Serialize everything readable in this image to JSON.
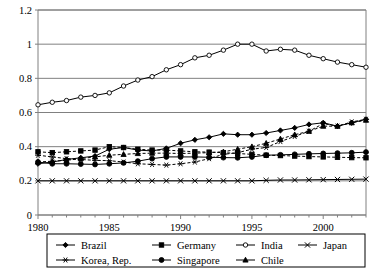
{
  "chart_data": {
    "type": "line",
    "title": "",
    "xlabel": "",
    "ylabel": "",
    "xlim": [
      1980,
      2003
    ],
    "ylim": [
      0,
      1.2
    ],
    "yticks": [
      "0",
      "0.2",
      "0.4",
      "0.6",
      "0.8",
      "1",
      "1.2"
    ],
    "ytick_values": [
      0,
      0.2,
      0.4,
      0.6,
      0.8,
      1.0,
      1.2
    ],
    "xticks": [
      "1980",
      "1985",
      "1990",
      "1995",
      "2000"
    ],
    "xtick_values": [
      1980,
      1985,
      1990,
      1995,
      2000
    ],
    "x": [
      1980,
      1981,
      1982,
      1983,
      1984,
      1985,
      1986,
      1987,
      1988,
      1989,
      1990,
      1991,
      1992,
      1993,
      1994,
      1995,
      1996,
      1997,
      1998,
      1999,
      2000,
      2001,
      2002,
      2003
    ],
    "grid": "horizontal",
    "legend_position": "bottom",
    "series": [
      {
        "name": "Brazil",
        "marker": "diamond",
        "dash": false,
        "values": [
          0.3,
          0.31,
          0.325,
          0.335,
          0.345,
          0.385,
          0.395,
          0.38,
          0.375,
          0.39,
          0.42,
          0.44,
          0.455,
          0.475,
          0.47,
          0.47,
          0.48,
          0.495,
          0.51,
          0.53,
          0.54,
          0.52,
          0.54,
          0.56
        ]
      },
      {
        "name": "Germany",
        "marker": "square",
        "dash": true,
        "values": [
          0.37,
          0.365,
          0.37,
          0.375,
          0.38,
          0.4,
          0.395,
          0.385,
          0.38,
          0.38,
          0.375,
          0.37,
          0.368,
          0.365,
          0.36,
          0.355,
          0.35,
          0.348,
          0.345,
          0.342,
          0.34,
          0.338,
          0.336,
          0.335
        ]
      },
      {
        "name": "India",
        "marker": "circle-open",
        "dash": false,
        "values": [
          0.645,
          0.66,
          0.67,
          0.69,
          0.7,
          0.715,
          0.755,
          0.79,
          0.81,
          0.85,
          0.88,
          0.92,
          0.935,
          0.965,
          1.0,
          1.0,
          0.96,
          0.97,
          0.965,
          0.935,
          0.915,
          0.895,
          0.88,
          0.865
        ]
      },
      {
        "name": "Japan",
        "marker": "cross",
        "dash": false,
        "values": [
          0.2,
          0.2,
          0.2,
          0.2,
          0.2,
          0.2,
          0.2,
          0.2,
          0.2,
          0.2,
          0.2,
          0.2,
          0.2,
          0.2,
          0.2,
          0.2,
          0.203,
          0.205,
          0.205,
          0.206,
          0.207,
          0.208,
          0.209,
          0.21
        ]
      },
      {
        "name": "Korea, Rep.",
        "marker": "star",
        "dash": true,
        "values": [
          0.35,
          0.34,
          0.33,
          0.325,
          0.32,
          0.318,
          0.31,
          0.3,
          0.296,
          0.292,
          0.3,
          0.31,
          0.33,
          0.355,
          0.365,
          0.385,
          0.395,
          0.43,
          0.46,
          0.49,
          0.535,
          0.52,
          0.545,
          0.56
        ]
      },
      {
        "name": "Singapore",
        "marker": "circle",
        "dash": false,
        "values": [
          0.31,
          0.3,
          0.3,
          0.298,
          0.296,
          0.3,
          0.305,
          0.315,
          0.33,
          0.34,
          0.34,
          0.34,
          0.338,
          0.336,
          0.335,
          0.34,
          0.35,
          0.352,
          0.355,
          0.358,
          0.36,
          0.362,
          0.364,
          0.368
        ]
      },
      {
        "name": "Chile",
        "marker": "triangle",
        "dash": true,
        "values": [
          0.31,
          0.315,
          0.32,
          0.33,
          0.34,
          0.35,
          0.355,
          0.36,
          0.362,
          0.362,
          0.36,
          0.362,
          0.365,
          0.37,
          0.385,
          0.4,
          0.42,
          0.445,
          0.47,
          0.49,
          0.52,
          0.52,
          0.54,
          0.555
        ]
      }
    ]
  },
  "legend": {
    "rows": [
      [
        {
          "label": "Brazil",
          "marker": "diamond",
          "dash": false
        },
        {
          "label": "Germany",
          "marker": "square",
          "dash": false
        },
        {
          "label": "India",
          "marker": "circle-open",
          "dash": false
        },
        {
          "label": "Japan",
          "marker": "cross",
          "dash": false
        }
      ],
      [
        {
          "label": "Korea, Rep.",
          "marker": "star",
          "dash": false
        },
        {
          "label": "Singapore",
          "marker": "circle",
          "dash": false
        },
        {
          "label": "Chile",
          "marker": "triangle",
          "dash": false
        }
      ]
    ]
  },
  "colors": {
    "line": "#000000",
    "grid": "#808080",
    "axis": "#808080",
    "background": "#ffffff",
    "text": "#000000"
  }
}
